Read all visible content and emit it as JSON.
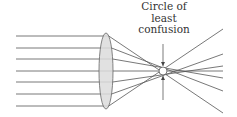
{
  "label": {
    "line1": "Circle of",
    "line2": "least",
    "line3": "confusion"
  },
  "colors": {
    "ray": "#555555",
    "lens_fill": "#dcdcdc",
    "lens_stroke": "#666666",
    "arrow": "#444444",
    "text": "#333333"
  },
  "lens": {
    "cx": 106,
    "cy": 71,
    "rx": 7,
    "ry": 38
  },
  "rays": [
    {
      "y_in": 36,
      "y_lens": 36,
      "end_x": 223,
      "end_y": 113
    },
    {
      "y_in": 48,
      "y_lens": 48,
      "end_x": 223,
      "end_y": 91
    },
    {
      "y_in": 59,
      "y_lens": 59,
      "end_x": 223,
      "end_y": 78
    },
    {
      "y_in": 71,
      "y_lens": 71,
      "end_x": 223,
      "end_y": 71
    },
    {
      "y_in": 82,
      "y_lens": 82,
      "end_x": 223,
      "end_y": 66
    },
    {
      "y_in": 94,
      "y_lens": 94,
      "end_x": 223,
      "end_y": 54
    },
    {
      "y_in": 106,
      "y_lens": 106,
      "end_x": 223,
      "end_y": 29
    }
  ],
  "circle_of_least_confusion": {
    "x": 163,
    "y": 71,
    "radius": 4
  },
  "arrows": {
    "x": 163,
    "top_start": 44,
    "top_end": 66,
    "bottom_start": 100,
    "bottom_end": 76
  }
}
